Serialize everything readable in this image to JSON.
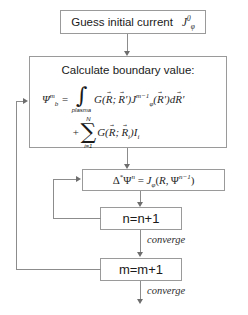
{
  "diagram": {
    "type": "flowchart",
    "line_color": "#8c8c8c",
    "text_color": "#1a1a1a",
    "background": "#ffffff"
  },
  "nodes": {
    "guess": {
      "id": "guess-initial-current",
      "text": "Guess initial current",
      "symbol": {
        "base": "J",
        "sub": "φ",
        "sup": "0"
      }
    },
    "calculate": {
      "id": "calculate-boundary-value",
      "headline": "Calculate boundary value:",
      "equation_line1": {
        "lhs": {
          "base": "Ψ",
          "sub": "b",
          "sup": "m"
        },
        "equals": "=",
        "operator": "∫",
        "operator_limit": "plasma",
        "green_fn": "G(",
        "args": "R⃗; R⃗′",
        "current": {
          "base": "J",
          "sub": "φ",
          "sup": "m−1"
        },
        "tail": "(R⃗′)dR⃗′"
      },
      "equation_line2": {
        "plus": "+",
        "operator": "∑",
        "limit_lower": "i=1",
        "limit_upper": "N",
        "term": "G(R⃗; R⃗i)Ii"
      }
    },
    "grad_shafranov": {
      "id": "grad-shafranov-equation",
      "lhs": {
        "delta": "Δ",
        "star": "*",
        "psi": "Ψ",
        "sup": "n"
      },
      "equals": "=",
      "rhs": {
        "base": "J",
        "sub": "φ",
        "open": "(",
        "arg1": "R",
        "comma": ",",
        "arg2": "Ψ",
        "arg2_sup": "n−1",
        "close": ")"
      }
    },
    "increment_n": {
      "id": "increment-n",
      "text": "n=n+1"
    },
    "increment_m": {
      "id": "increment-m",
      "text": "m=m+1"
    }
  },
  "edge_labels": {
    "converge_inner": "converge",
    "converge_outer": "converge"
  }
}
